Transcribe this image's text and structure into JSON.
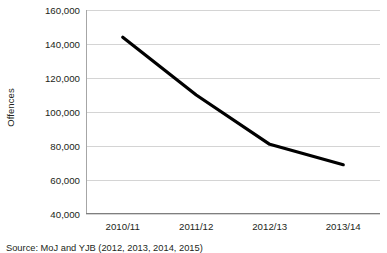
{
  "chart_data": {
    "type": "line",
    "title": "",
    "subtitle": "",
    "xlabel": "",
    "ylabel": "Offences",
    "categories": [
      "2010/11",
      "2011/12",
      "2012/13",
      "2013/14"
    ],
    "series": [
      {
        "name": "Offences",
        "values": [
          144000,
          110000,
          81000,
          69000
        ]
      }
    ],
    "ylim": [
      40000,
      160000
    ],
    "ytick_step": 20000,
    "ytick_labels": [
      "160,000",
      "140,000",
      "120,000",
      "100,000",
      "80,000",
      "60,000",
      "40,000"
    ],
    "ytick_values": [
      160000,
      140000,
      120000,
      100000,
      80000,
      60000,
      40000
    ],
    "grid": "horizontal",
    "legend": "none",
    "line_color": "#000000",
    "gridline_color": "#d4d4d4",
    "axis_color": "#7f7f7f",
    "background_color": "#ffffff"
  },
  "source": {
    "text": "Source: MoJ and YJB (2012, 2013, 2014, 2015)"
  }
}
